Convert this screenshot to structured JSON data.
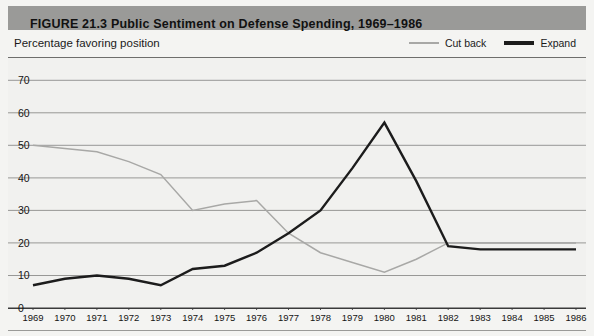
{
  "figure": {
    "title": "FIGURE 21.3   Public Sentiment on Defense Spending, 1969–1986",
    "y_axis_caption": "Percentage favoring position"
  },
  "legend": {
    "position": "top-right",
    "entries": [
      {
        "label": "Cut back",
        "color": "#a8a8a6",
        "icon": "line-swatch-light"
      },
      {
        "label": "Expand",
        "color": "#1c1c1c",
        "icon": "line-swatch-dark"
      }
    ]
  },
  "chart_data": {
    "type": "line",
    "title": "Public Sentiment on Defense Spending, 1969–1986",
    "xlabel": "",
    "ylabel": "Percentage favoring position",
    "xlim": [
      1969,
      1986
    ],
    "ylim": [
      0,
      75
    ],
    "yticks": [
      0,
      10,
      20,
      30,
      40,
      50,
      60,
      70
    ],
    "grid": true,
    "x": [
      1969,
      1970,
      1971,
      1972,
      1973,
      1974,
      1975,
      1976,
      1977,
      1978,
      1979,
      1980,
      1981,
      1982,
      1983,
      1984,
      1985,
      1986
    ],
    "series": [
      {
        "name": "Cut back",
        "color": "#a8a8a6",
        "values": [
          50,
          49,
          48,
          45,
          41,
          30,
          32,
          33,
          23,
          17,
          14,
          11,
          15,
          20,
          20,
          20,
          20,
          20
        ]
      },
      {
        "name": "Expand",
        "color": "#1c1c1c",
        "values": [
          7,
          9,
          10,
          9,
          7,
          12,
          13,
          17,
          23,
          30,
          43,
          57,
          39,
          19,
          18,
          18,
          18,
          18
        ]
      }
    ]
  }
}
